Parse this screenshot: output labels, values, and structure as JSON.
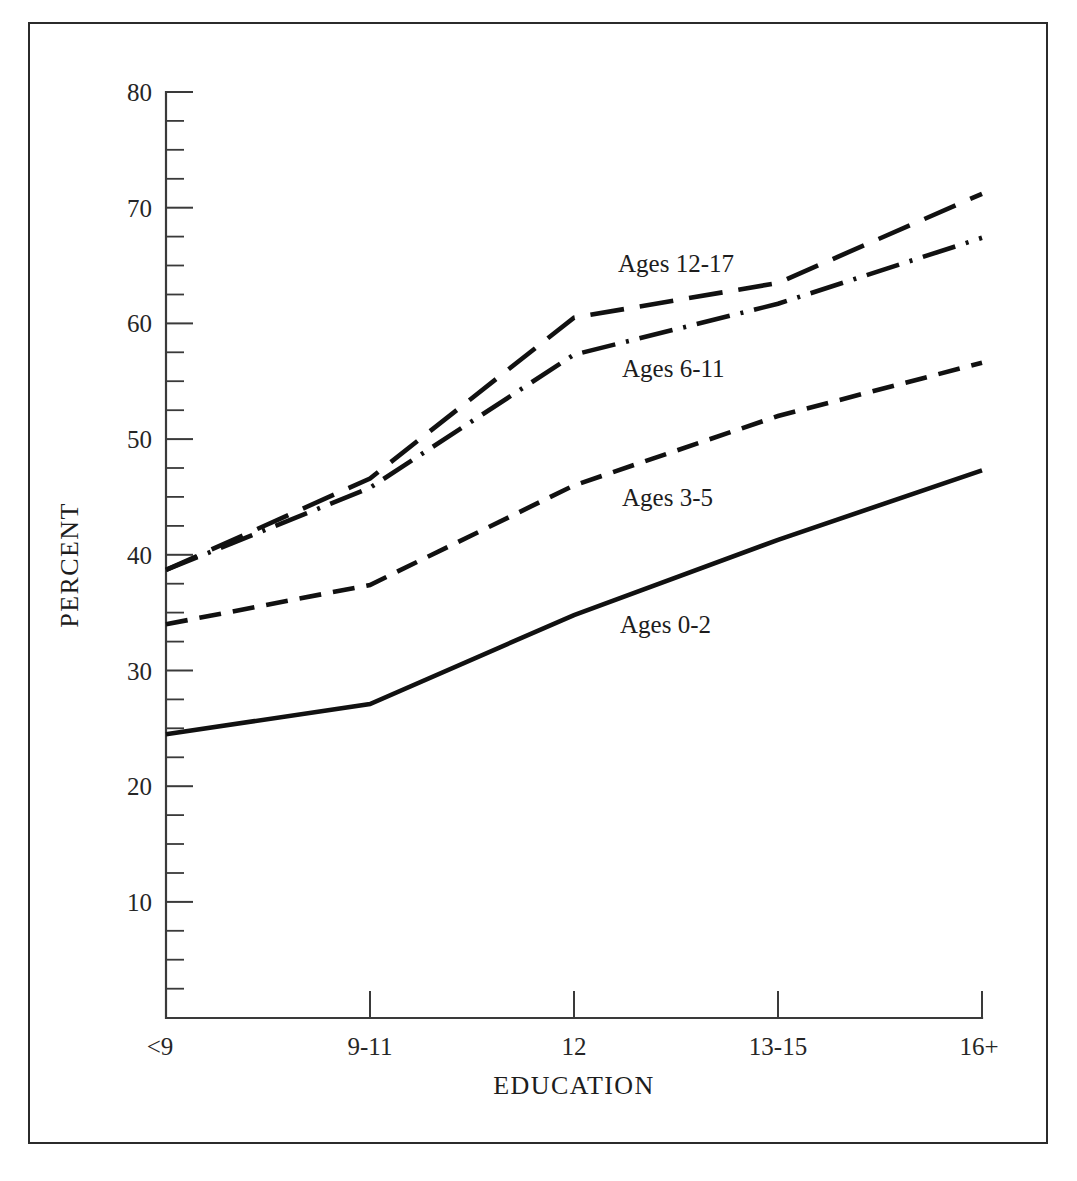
{
  "figure": {
    "name": "education-by-child-age-line-chart"
  },
  "axes": {
    "y": {
      "title": "PERCENT",
      "tick_labels": [
        "80",
        "70",
        "60",
        "50",
        "40",
        "30",
        "20",
        "10"
      ],
      "tick_values": [
        80,
        70,
        60,
        50,
        40,
        30,
        20,
        10
      ],
      "min": 0,
      "max": 80,
      "minor_tick_step": 2.5
    },
    "x": {
      "title": "EDUCATION",
      "tick_labels": [
        "<9",
        "9-11",
        "12",
        "13-15",
        "16+"
      ]
    }
  },
  "series_labels": {
    "ages_12_17": "Ages 12-17",
    "ages_6_11": "Ages 6-11",
    "ages_3_5": "Ages 3-5",
    "ages_0_2": "Ages 0-2"
  },
  "chart_data": {
    "type": "line",
    "title": "",
    "xlabel": "EDUCATION",
    "ylabel": "PERCENT",
    "categories": [
      "<9",
      "9-11",
      "12",
      "13-15",
      "16+"
    ],
    "ylim": [
      0,
      80
    ],
    "xlim": [
      0,
      4
    ],
    "grid": false,
    "legend_position": "inline-annotations",
    "series": [
      {
        "name": "Ages 12-17",
        "linestyle": "long-dash",
        "color": "#111111",
        "values": [
          38.7,
          46.6,
          60.5,
          63.5,
          71.2
        ]
      },
      {
        "name": "Ages 6-11",
        "linestyle": "dash-dot",
        "color": "#111111",
        "values": [
          38.7,
          45.8,
          57.3,
          61.7,
          67.4
        ]
      },
      {
        "name": "Ages 3-5",
        "linestyle": "medium-dash",
        "color": "#111111",
        "values": [
          34.0,
          37.4,
          46.0,
          52.0,
          56.6
        ]
      },
      {
        "name": "Ages 0-2",
        "linestyle": "solid",
        "color": "#111111",
        "values": [
          24.5,
          27.1,
          34.8,
          41.3,
          47.3
        ]
      }
    ]
  }
}
